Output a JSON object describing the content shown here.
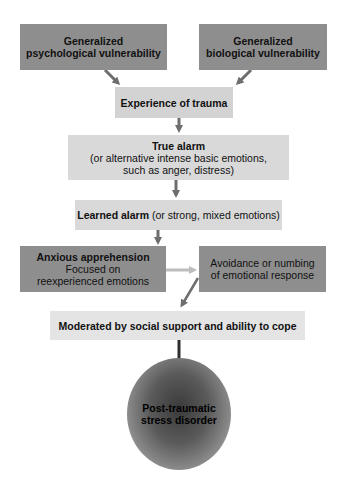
{
  "nodes": {
    "psych_vuln": {
      "lines": [
        "Generalized",
        "psychological vulnerability"
      ]
    },
    "bio_vuln": {
      "lines": [
        "Generalized",
        "biological vulnerability"
      ]
    },
    "trauma": {
      "label": "Experience of trauma"
    },
    "true_alarm": {
      "title": "True alarm",
      "lines": [
        "(or alternative intense basic emotions,",
        "such as anger, distress)"
      ]
    },
    "learned_alarm": {
      "title": "Learned alarm",
      "rest": " (or strong, mixed emotions)"
    },
    "anxious": {
      "title": "Anxious apprehension",
      "lines": [
        "Focused on",
        "reexperienced emotions"
      ]
    },
    "avoidance": {
      "lines": [
        "Avoidance or numbing",
        "of emotional response"
      ]
    },
    "moderated": {
      "label": "Moderated by social support and ability to cope"
    },
    "ptsd": {
      "lines": [
        "Post-traumatic",
        "stress disorder"
      ]
    }
  },
  "colors": {
    "dark_box": "#8e8e8e",
    "light_box": "#d3d3d3",
    "lighter_box": "#e4e4e4",
    "arrow": "#6e6e6e",
    "arrow_light": "#bdbdbd",
    "arrow_dark": "#2e2e2e"
  }
}
